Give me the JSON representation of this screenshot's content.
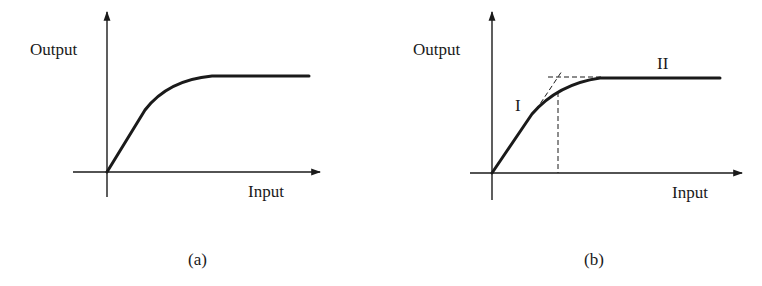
{
  "figure": {
    "panels": [
      {
        "id": "a",
        "caption": "(a)",
        "y_axis_label": "Output",
        "x_axis_label": "Input",
        "curve": "saturation-curve"
      },
      {
        "id": "b",
        "caption": "(b)",
        "y_axis_label": "Output",
        "x_axis_label": "Input",
        "curve": "saturation-curve",
        "region_labels": [
          "I",
          "II"
        ],
        "annotations": [
          "dashed-tangent-linear-region",
          "dashed-horizontal-saturation-level",
          "dashed-vertical-breakpoint"
        ]
      }
    ],
    "colors": {
      "ink": "#1a1a1a",
      "background": "#ffffff"
    }
  }
}
